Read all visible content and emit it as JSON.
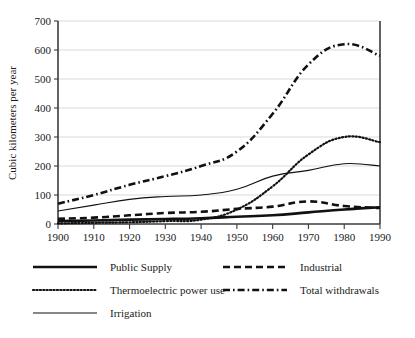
{
  "chart_data": {
    "type": "line",
    "title": "",
    "subtitle": "",
    "xlabel": "",
    "ylabel": "Cubic kilometers per year",
    "xlim": [
      1900,
      1990
    ],
    "ylim": [
      0,
      700
    ],
    "grid": true,
    "legend_position": "bottom",
    "x": [
      1900,
      1910,
      1920,
      1930,
      1940,
      1950,
      1960,
      1970,
      1980,
      1990
    ],
    "x_tick_labels": [
      "1900",
      "1910",
      "1920",
      "1930",
      "1940",
      "1950",
      "1960",
      "1970",
      "1980",
      "1990"
    ],
    "y_tick_labels": [
      "0",
      "100",
      "200",
      "300",
      "400",
      "500",
      "600",
      "700"
    ],
    "y_ticks": [
      0,
      100,
      200,
      300,
      400,
      500,
      600,
      700
    ],
    "series": [
      {
        "name": "Public Supply",
        "style": "thick-solid",
        "color": "#111111",
        "values": [
          10,
          12,
          15,
          17,
          20,
          25,
          30,
          40,
          50,
          58
        ]
      },
      {
        "name": "Industrial",
        "style": "thick-dashed",
        "color": "#111111",
        "values": [
          18,
          22,
          30,
          38,
          42,
          52,
          60,
          78,
          62,
          55
        ]
      },
      {
        "name": "Thermoelectric power use",
        "style": "dotted",
        "color": "#111111",
        "values": [
          2,
          4,
          6,
          10,
          15,
          50,
          130,
          240,
          300,
          282
        ]
      },
      {
        "name": "Total withdrawals",
        "style": "dash-dot",
        "color": "#111111",
        "values": [
          70,
          100,
          135,
          165,
          200,
          250,
          380,
          550,
          620,
          580
        ]
      },
      {
        "name": "Irrigation",
        "style": "thin-solid",
        "color": "#111111",
        "values": [
          45,
          65,
          85,
          95,
          100,
          120,
          165,
          185,
          208,
          200
        ]
      }
    ]
  },
  "axis": {
    "y_title": "Cubic kilometers per year"
  },
  "legend": {
    "entries": [
      {
        "label": "Public Supply",
        "key": "s-public"
      },
      {
        "label": "Industrial",
        "key": "s-industrial"
      },
      {
        "label": "Thermoelectric power use",
        "key": "s-thermo"
      },
      {
        "label": "Total withdrawals",
        "key": "s-total"
      },
      {
        "label": "Irrigation",
        "key": "s-irrigation"
      }
    ]
  },
  "colors": {
    "ink": "#111111",
    "grid": "#c9c9c9",
    "axis": "#3b3b3b",
    "background": "#ffffff"
  }
}
